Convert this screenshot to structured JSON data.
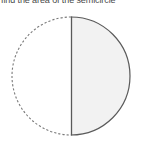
{
  "prompt": {
    "text": "find the area of the semicircle"
  },
  "figure": {
    "caption": "circle-with-vertical-diameter",
    "colors": {
      "shaded_half_fill": "#f2f2f2",
      "unshaded_half_fill": "#ffffff",
      "solid_arc_stroke": "#5a5a5a",
      "dashed_arc_stroke": "#7a7a7a",
      "diameter_stroke": "#5a5a5a",
      "background": "#ffffff"
    },
    "geometry": {
      "center_x": 71,
      "center_y": 76,
      "radius": 59,
      "diameter_x": 71,
      "diameter_top_y": 17,
      "diameter_bottom_y": 135
    },
    "parts": {
      "left_half_label": "unshaded-left-half",
      "right_half_label": "shaded-right-half",
      "left_arc_style": "dashed",
      "right_arc_style": "solid",
      "diameter_label": "vertical-diameter"
    }
  }
}
